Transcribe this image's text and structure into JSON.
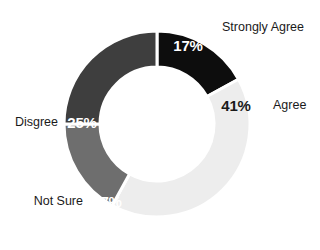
{
  "chart_data": {
    "type": "pie",
    "variant": "donut",
    "title": "",
    "subtitle": "",
    "xlabel": "",
    "ylabel": "",
    "grid": false,
    "legend_position": "none",
    "labels_inline": true,
    "total": 100,
    "units": "%",
    "background_color": "#ffffff",
    "center_color": "#ffffff",
    "separator_color": "#ffffff",
    "start_angle_deg": 0,
    "direction": "clockwise",
    "center_x": 157,
    "center_y": 124,
    "outer_radius": 93,
    "inner_radius": 57,
    "categories": [
      "Strongly Agree",
      "Agree",
      "Not Sure",
      "Disgree"
    ],
    "values": [
      17,
      41,
      17,
      25
    ],
    "value_labels": [
      "17%",
      "41%",
      "17%",
      "25%"
    ],
    "colors": [
      "#0d0d0d",
      "#ededed",
      "#6e6e6e",
      "#3e3e3e"
    ],
    "slices": [
      {
        "name": "Strongly Agree",
        "value": 17,
        "value_label": "17%",
        "color": "#0d0d0d",
        "value_label_color": "#ffffff",
        "category_label_color": "#1a1a1a",
        "start_angle_deg": 0,
        "end_angle_deg": 61.2,
        "value_label_x": 188,
        "value_label_y": 47,
        "category_label_x": 222,
        "category_label_y": 28,
        "category_anchor": "start"
      },
      {
        "name": "Agree",
        "value": 41,
        "value_label": "41%",
        "color": "#ededed",
        "value_label_color": "#1a1a1a",
        "category_label_color": "#1a1a1a",
        "start_angle_deg": 61.2,
        "end_angle_deg": 208.8,
        "value_label_x": 236,
        "value_label_y": 107,
        "category_label_x": 273,
        "category_label_y": 106,
        "category_anchor": "start"
      },
      {
        "name": "Not Sure",
        "value": 17,
        "value_label": "17%",
        "color": "#6e6e6e",
        "value_label_color": "#ffffff",
        "category_label_color": "#1a1a1a",
        "start_angle_deg": 208.8,
        "end_angle_deg": 270.0,
        "value_label_x": 107,
        "value_label_y": 203,
        "category_label_x": 83,
        "category_label_y": 202,
        "category_anchor": "end"
      },
      {
        "name": "Disgree",
        "value": 25,
        "value_label": "25%",
        "color": "#3e3e3e",
        "value_label_color": "#ffffff",
        "category_label_color": "#1a1a1a",
        "start_angle_deg": 270.0,
        "end_angle_deg": 360.0,
        "value_label_x": 82,
        "value_label_y": 124,
        "category_label_x": 58,
        "category_label_y": 123,
        "category_anchor": "end"
      }
    ]
  }
}
